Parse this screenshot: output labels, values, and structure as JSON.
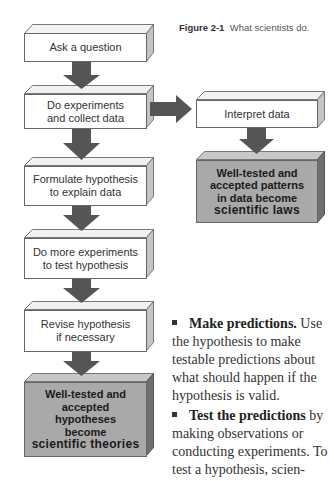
{
  "caption": {
    "label": "Figure 2-1",
    "text": "What scientists do."
  },
  "flow": {
    "steps": [
      {
        "id": "ask",
        "text": "Ask a question"
      },
      {
        "id": "experiment",
        "line1": "Do experiments",
        "line2": "and collect data"
      },
      {
        "id": "hypothesis",
        "line1": "Formulate hypothesis",
        "line2": "to explain data"
      },
      {
        "id": "more",
        "line1": "Do more experiments",
        "line2": "to test hypothesis"
      },
      {
        "id": "revise",
        "line1": "Revise hypothesis",
        "line2": "if necessary"
      },
      {
        "id": "theories",
        "line1": "Well-tested and",
        "line2": "accepted",
        "line3": "hypotheses",
        "line4": "become",
        "line5": "scientific theories"
      }
    ],
    "branch": {
      "interpret": {
        "text": "Interpret data"
      },
      "laws": {
        "line1": "Well-tested and",
        "line2": "accepted patterns",
        "line3": "in data become",
        "line4": "scientific laws"
      }
    },
    "colors": {
      "arrow": "#555555",
      "gray_box": "#a9a9a9",
      "white_box": "#ffffff"
    }
  },
  "body": {
    "para1": {
      "bold": "Make predictions.",
      "rest": " Use the hypothesis to make testable predictions about what should happen if the hypothesis is valid."
    },
    "para2": {
      "bold": "Test the predictions",
      "rest": " by making observations or conducting experiments. To test a hypothesis, scien-"
    }
  }
}
